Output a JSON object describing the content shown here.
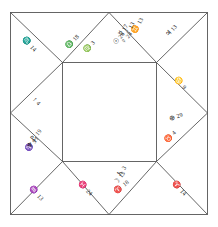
{
  "chart": {
    "type": "square-astrological-chart",
    "style": "medieval square chart with outer square, inner square and corner diagonals",
    "background_color": "#ffffff",
    "line_color": "#555555",
    "text_color": "#1a1a1a",
    "geometry": {
      "outer_square": {
        "x": 10,
        "y": 12,
        "w": 198,
        "h": 203
      },
      "inner_square": {
        "x": 62,
        "y": 62,
        "w": 95,
        "h": 100
      },
      "diagonals": "each outer corner connects to the nearest inner-square corner; outer edge midpoints connect to inner-square corners"
    },
    "houses": [
      {
        "house": 1,
        "position": "left-middle",
        "is_ascendant": true,
        "cusp": {
          "icon": "ascendant-arrow-icon",
          "symbol": "↑",
          "degree": "4"
        },
        "planets": []
      },
      {
        "house": 2,
        "position": "upper-left-outer",
        "cusp": {
          "icon": "scorpio-icon",
          "symbol": "♏",
          "degree": "14"
        },
        "planets": []
      },
      {
        "house": 3,
        "position": "top-left",
        "cusp": {
          "icon": "libra-icon",
          "symbol": "♎",
          "degree": "18"
        },
        "planets": []
      },
      {
        "house": 4,
        "position": "top-center-left",
        "cusp": {
          "icon": "virgo-icon",
          "symbol": "♍",
          "degree": "3"
        },
        "planets": []
      },
      {
        "house": 5,
        "position": "top-center-right",
        "cusp": {
          "icon": "gemini-icon",
          "symbol": "♊",
          "degree": "13"
        },
        "planets": [
          {
            "icon": "sun-icon",
            "symbol": "☉",
            "degree": "26"
          },
          {
            "icon": "venus-icon",
            "symbol": "♀",
            "degree": "24"
          },
          {
            "icon": "mercury-icon",
            "symbol": "☿",
            "degree": "17"
          },
          {
            "icon": "mars-icon",
            "symbol": "♂",
            "degree": "13"
          }
        ]
      },
      {
        "house": 6,
        "position": "upper-right-outer",
        "cusp": {
          "icon": "jupiter-icon",
          "symbol": "♃",
          "degree": "13"
        },
        "planets": []
      },
      {
        "house": 7,
        "position": "right-upper",
        "cusp": {
          "icon": "cancer-icon",
          "symbol": "♋",
          "degree": "9"
        },
        "planets": []
      },
      {
        "house": 8,
        "position": "right-middle",
        "cusp": {
          "icon": "earth-icon",
          "symbol": "⊕",
          "degree": "29"
        },
        "planets": []
      },
      {
        "house": 9,
        "position": "right-lower",
        "cusp": {
          "icon": "taurus-icon",
          "symbol": "♉",
          "degree": "4"
        },
        "planets": []
      },
      {
        "house": 10,
        "position": "lower-right-outer",
        "cusp": {
          "icon": "aries-icon",
          "symbol": "♈",
          "degree": "14"
        },
        "planets": []
      },
      {
        "house": 11,
        "position": "bottom-center-right",
        "cusp": {
          "icon": "aries-icon",
          "symbol": "♈",
          "degree": "18"
        },
        "planets": [
          {
            "icon": "saturn-icon",
            "symbol": "♄",
            "degree": "3"
          },
          {
            "icon": "moon-icon",
            "symbol": "☽",
            "degree": "13"
          }
        ]
      },
      {
        "house": 12,
        "position": "bottom-center-left",
        "cusp": {
          "icon": "pisces-icon",
          "symbol": "♓",
          "degree": "24"
        },
        "planets": []
      },
      {
        "house": 13,
        "position": "bottom-left",
        "cusp": {
          "icon": "aquarius-icon",
          "symbol": "♒",
          "degree": "13"
        },
        "planets": []
      },
      {
        "house": 14,
        "position": "lower-left-outer",
        "cusp": {
          "icon": "capricorn-icon",
          "symbol": "♑",
          "degree": "9"
        },
        "planets": [
          {
            "icon": "pluto-icon",
            "symbol": "♇",
            "degree": "19"
          },
          {
            "icon": "neptune-icon",
            "symbol": "♆",
            "degree": "11"
          }
        ]
      }
    ]
  }
}
